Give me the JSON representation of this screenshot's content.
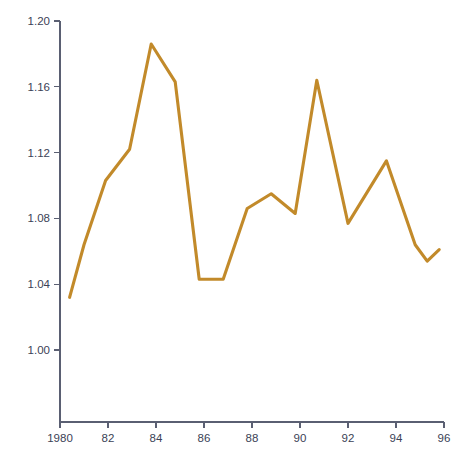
{
  "chart_data": {
    "type": "line",
    "title": "",
    "subtitle": "",
    "xlabel": "",
    "ylabel": "",
    "grid": false,
    "legend": false,
    "legend_position": "none",
    "line_color": "#c28a2a",
    "axis_color": "#5a5f72",
    "background_color": "#ffffff",
    "xlim": [
      1979.3,
      1996.3
    ],
    "ylim": [
      0.972,
      1.205
    ],
    "x_tick_labels": [
      "1980",
      "82",
      "84",
      "86",
      "88",
      "90",
      "92",
      "94",
      "96"
    ],
    "x_tick_values": [
      1980,
      1982,
      1984,
      1986,
      1988,
      1990,
      1992,
      1994,
      1996
    ],
    "y_tick_labels": [
      "1.20",
      "1.16",
      "1.12",
      "1.08",
      "1.04",
      "1.00"
    ],
    "y_tick_values": [
      1.2,
      1.16,
      1.12,
      1.08,
      1.04,
      1.0
    ],
    "series": [
      {
        "name": "series-1",
        "color": "#c28a2a",
        "x": [
          1980.4,
          1981.0,
          1981.9,
          1982.9,
          1983.8,
          1984.8,
          1985.8,
          1986.8,
          1987.8,
          1988.8,
          1989.8,
          1990.7,
          1992.0,
          1993.6,
          1994.8,
          1995.3,
          1995.8
        ],
        "values": [
          1.032,
          1.064,
          1.103,
          1.122,
          1.186,
          1.163,
          1.043,
          1.043,
          1.086,
          1.095,
          1.083,
          1.164,
          1.077,
          1.115,
          1.064,
          1.054,
          1.061
        ]
      }
    ]
  }
}
